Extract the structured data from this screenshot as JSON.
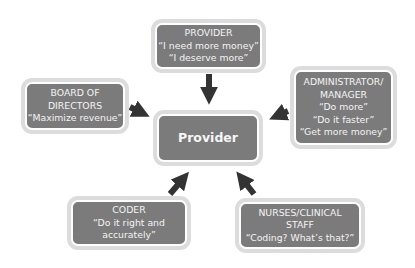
{
  "diagram": {
    "center": {
      "label": "Provider"
    },
    "nodes": [
      {
        "id": "provider",
        "lines": [
          "PROVIDER",
          "“I need more money”",
          "“I deserve more”"
        ]
      },
      {
        "id": "board",
        "lines": [
          "BOARD OF",
          "DIRECTORS",
          "“Maximize revenue”"
        ]
      },
      {
        "id": "admin",
        "lines": [
          "ADMINISTRATOR/",
          "MANAGER",
          "“Do more”",
          "“Do it faster”",
          "“Get more money”"
        ]
      },
      {
        "id": "coder",
        "lines": [
          "CODER",
          "“Do it right and",
          "accurately”"
        ]
      },
      {
        "id": "nurses",
        "lines": [
          "NURSES/CLINICAL",
          "STAFF",
          "“Coding?  What’s that?”"
        ]
      }
    ],
    "edges": [
      {
        "from": "provider",
        "to": "center"
      },
      {
        "from": "board",
        "to": "center"
      },
      {
        "from": "admin",
        "to": "center"
      },
      {
        "from": "coder",
        "to": "center"
      },
      {
        "from": "nurses",
        "to": "center"
      }
    ],
    "colors": {
      "box_fill": "#7b7b7b",
      "box_border": "#dcdcdc",
      "arrow": "#333333",
      "text": "#f4f4f4"
    }
  }
}
